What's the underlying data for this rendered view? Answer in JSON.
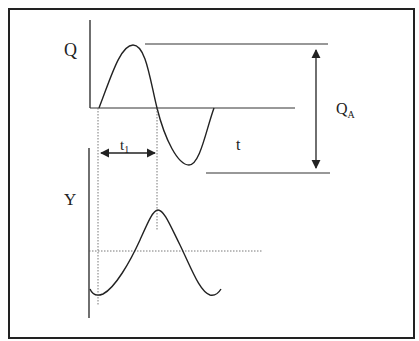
{
  "diagram": {
    "labels": {
      "q_axis": "Q",
      "y_axis": "Y",
      "time": "t",
      "t1_main": "t",
      "t1_sub": "1",
      "amplitude_main": "Q",
      "amplitude_sub": "A"
    },
    "colors": {
      "line": "#222222",
      "frame": "#222222",
      "background": "#ffffff"
    }
  }
}
